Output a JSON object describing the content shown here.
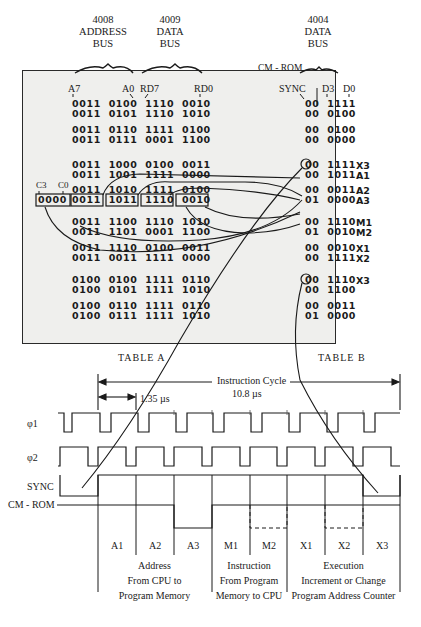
{
  "bus_headers": [
    {
      "chip": "4008",
      "line1": "ADDRESS",
      "line2": "BUS"
    },
    {
      "chip": "4009",
      "line1": "DATA",
      "line2": "BUS"
    },
    {
      "chip": "4004",
      "line1": "DATA",
      "line2": "BUS"
    }
  ],
  "cm_rom_header": "CM - ROM",
  "table_a": {
    "caption": "TABLE A",
    "column_labels": {
      "a7": "A7",
      "a0": "A0",
      "rd7": "RD7",
      "rd0": "RD0",
      "c3": "C3",
      "c0": "C0"
    },
    "rows": [
      "0011  0100  1110  0010",
      "0011  0101  1110  1010",
      "0011  0110  1111  0100",
      "0011  0111  0001  1100",
      "0011  1000  0100  0011",
      "0011  1001  1111  0000",
      "0011  1010  1111  0100",
      "0011  1011  1110  0010",
      "0011  1100  1110  1010",
      "0011  1101  0001  1100",
      "0011  1110  0100  0011",
      "0011  0011  1111  0000",
      "0100  0100  1111  0110",
      "0100  0101  1111  1010",
      "0100  0110  1111  0110",
      "0100  0111  1111  1010"
    ],
    "highlighted_prefix": "0000"
  },
  "table_b": {
    "caption": "TABLE B",
    "column_labels": {
      "sync": "SYNC",
      "d3": "D3",
      "d0": "D0"
    },
    "rows": [
      {
        "bits": "00  1111",
        "cycle": ""
      },
      {
        "bits": "00  0100",
        "cycle": ""
      },
      {
        "bits": "00  0100",
        "cycle": ""
      },
      {
        "bits": "00  0000",
        "cycle": ""
      },
      {
        "bits": "00  1111",
        "cycle": "X3"
      },
      {
        "bits": "00  1011",
        "cycle": "A1"
      },
      {
        "bits": "00  0011",
        "cycle": "A2"
      },
      {
        "bits": "01  0000",
        "cycle": "A3"
      },
      {
        "bits": "00  1110",
        "cycle": "M1"
      },
      {
        "bits": "01  0010",
        "cycle": "M2"
      },
      {
        "bits": "00  0010",
        "cycle": "X1"
      },
      {
        "bits": "00  1111",
        "cycle": "X2"
      },
      {
        "bits": "00  1110",
        "cycle": "X3"
      },
      {
        "bits": "00  1100",
        "cycle": ""
      },
      {
        "bits": "00  0011",
        "cycle": ""
      },
      {
        "bits": "01  0000",
        "cycle": ""
      }
    ]
  },
  "timing": {
    "instruction_cycle_label": "Instruction Cycle",
    "instruction_cycle_value": "10.8 µs",
    "clock_period_label": "1.35 µs",
    "signals": [
      "φ1",
      "φ2",
      "SYNC",
      "CM - ROM"
    ],
    "phases": [
      "A1",
      "A2",
      "A3",
      "M1",
      "M2",
      "X1",
      "X2",
      "X3"
    ],
    "groups": [
      {
        "title": "Address",
        "line2": "From CPU to",
        "line3": "Program Memory"
      },
      {
        "title": "Instruction",
        "line2": "From Program",
        "line3": "Memory to CPU"
      },
      {
        "title": "Execution",
        "line2": "Increment or Change",
        "line3": "Program Address Counter"
      }
    ]
  }
}
